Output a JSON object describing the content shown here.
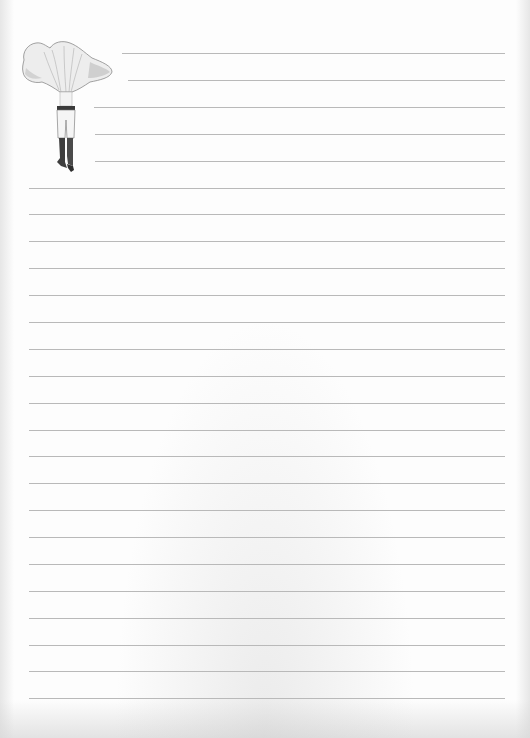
{
  "page": {
    "type": "lined-notepaper",
    "background_color": "#fdfdfd",
    "line_color": "#b9b9b9",
    "line_spacing_px": 27
  },
  "illustration": {
    "name": "mushroom-headed-figure",
    "description": "Vintage engraving of a chanterelle mushroom cap on a pair of legs in breeches and boots"
  },
  "lines": [
    {
      "y": 53,
      "x1": 122,
      "x2": 505
    },
    {
      "y": 80,
      "x1": 128,
      "x2": 505
    },
    {
      "y": 107,
      "x1": 94,
      "x2": 505
    },
    {
      "y": 134,
      "x1": 95,
      "x2": 505
    },
    {
      "y": 161,
      "x1": 95,
      "x2": 505
    },
    {
      "y": 188,
      "x1": 29,
      "x2": 505
    },
    {
      "y": 214,
      "x1": 29,
      "x2": 505
    },
    {
      "y": 241,
      "x1": 29,
      "x2": 505
    },
    {
      "y": 268,
      "x1": 29,
      "x2": 505
    },
    {
      "y": 295,
      "x1": 29,
      "x2": 505
    },
    {
      "y": 322,
      "x1": 29,
      "x2": 505
    },
    {
      "y": 349,
      "x1": 29,
      "x2": 505
    },
    {
      "y": 376,
      "x1": 29,
      "x2": 505
    },
    {
      "y": 403,
      "x1": 29,
      "x2": 505
    },
    {
      "y": 430,
      "x1": 29,
      "x2": 505
    },
    {
      "y": 456,
      "x1": 29,
      "x2": 505
    },
    {
      "y": 483,
      "x1": 29,
      "x2": 505
    },
    {
      "y": 510,
      "x1": 29,
      "x2": 505
    },
    {
      "y": 537,
      "x1": 29,
      "x2": 505
    },
    {
      "y": 564,
      "x1": 29,
      "x2": 505
    },
    {
      "y": 591,
      "x1": 29,
      "x2": 505
    },
    {
      "y": 618,
      "x1": 29,
      "x2": 505
    },
    {
      "y": 645,
      "x1": 29,
      "x2": 505
    },
    {
      "y": 671,
      "x1": 29,
      "x2": 505
    },
    {
      "y": 698,
      "x1": 29,
      "x2": 505
    }
  ]
}
